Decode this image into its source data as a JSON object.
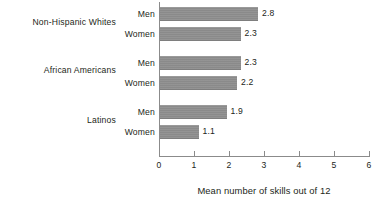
{
  "chart_data": {
    "type": "bar",
    "orientation": "horizontal",
    "title": "",
    "xlabel": "Mean number of skills out of 12",
    "ylabel": "",
    "xlim": [
      0,
      6
    ],
    "xticks": [
      "0",
      "1",
      "2",
      "3",
      "4",
      "5",
      "6"
    ],
    "grid": false,
    "legend": "none",
    "bar_color": "#8e8e8e",
    "axis_color": "#8b8b8b",
    "text_color": "#231f20",
    "groups": [
      {
        "label": "Non-Hispanic Whites",
        "bars": [
          {
            "series": "Men",
            "value": 2.8,
            "value_label": "2.8"
          },
          {
            "series": "Women",
            "value": 2.3,
            "value_label": "2.3"
          }
        ]
      },
      {
        "label": "African Americans",
        "bars": [
          {
            "series": "Men",
            "value": 2.3,
            "value_label": "2.3"
          },
          {
            "series": "Women",
            "value": 2.2,
            "value_label": "2.2"
          }
        ]
      },
      {
        "label": "Latinos",
        "bars": [
          {
            "series": "Men",
            "value": 1.9,
            "value_label": "1.9"
          },
          {
            "series": "Women",
            "value": 1.1,
            "value_label": "1.1"
          }
        ]
      }
    ],
    "categories": [
      "Non-Hispanic Whites",
      "African Americans",
      "Latinos"
    ],
    "series": [
      {
        "name": "Men",
        "values": [
          2.8,
          2.3,
          1.9
        ]
      },
      {
        "name": "Women",
        "values": [
          2.3,
          2.2,
          1.1
        ]
      }
    ]
  }
}
